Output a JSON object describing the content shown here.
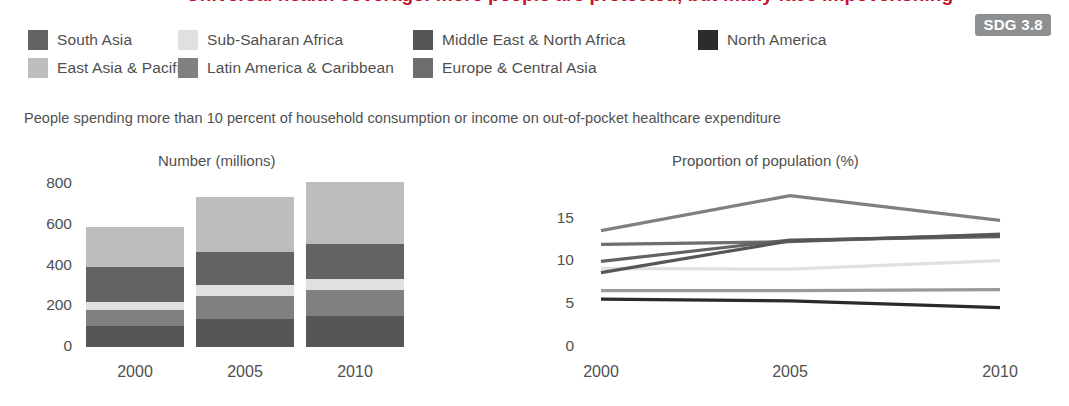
{
  "header": {
    "clipped_title": "Universal health coverage: more people are protected, but many face impoverishing",
    "badge": "SDG 3.8"
  },
  "legend": {
    "rows": [
      [
        {
          "label": "South Asia",
          "color": "#636363",
          "width": 150
        },
        {
          "label": "Sub-Saharan Africa",
          "color": "#e0e0e0",
          "width": 235
        },
        {
          "label": "Middle East & North Africa",
          "color": "#565656",
          "width": 285
        },
        {
          "label": "North America",
          "color": "#2b2b2b",
          "width": 180
        }
      ],
      [
        {
          "label": "East Asia & Pacific",
          "color": "#bdbdbd",
          "width": 150
        },
        {
          "label": "Latin America & Caribbean",
          "color": "#808080",
          "width": 235
        },
        {
          "label": "Europe & Central Asia",
          "color": "#6e6e6e",
          "width": 285
        }
      ]
    ]
  },
  "subtitle": "People spending more than 10 percent of household consumption or income on out-of-pocket healthcare expenditure",
  "chart_data": [
    {
      "type": "bar",
      "title": "Number (millions)",
      "xlabel": "",
      "ylabel": "",
      "categories": [
        "2000",
        "2005",
        "2010"
      ],
      "ylim": [
        0,
        800
      ],
      "yticks": [
        0,
        200,
        400,
        600,
        800
      ],
      "grid": false,
      "stacked": true,
      "series": [
        {
          "name": "East Asia & Pacific",
          "color": "#bdbdbd",
          "values": [
            196,
            273,
            300
          ]
        },
        {
          "name": "South Asia",
          "color": "#636363",
          "values": [
            171,
            160,
            176
          ]
        },
        {
          "name": "Sub-Saharan Africa",
          "color": "#e0e0e0",
          "values": [
            38,
            52,
            54
          ]
        },
        {
          "name": "Latin America & Caribbean",
          "color": "#808080",
          "values": [
            78,
            114,
            128
          ]
        },
        {
          "name": "Europe & Central Asia",
          "color": "#6e6e6e",
          "values": [
            0,
            0,
            0
          ]
        },
        {
          "name": "Middle East & North Africa",
          "color": "#565656",
          "values": [
            104,
            138,
            150
          ]
        },
        {
          "name": "North America",
          "color": "#2b2b2b",
          "values": [
            0,
            0,
            0
          ]
        }
      ],
      "totals": [
        587,
        737,
        808
      ]
    },
    {
      "type": "line",
      "title": "Proportion of population (%)",
      "xlabel": "",
      "ylabel": "",
      "x": [
        "2000",
        "2005",
        "2010"
      ],
      "ylim": [
        0,
        18
      ],
      "yticks": [
        0,
        5,
        10,
        15
      ],
      "grid": false,
      "series": [
        {
          "name": "Latin America & Caribbean",
          "color": "#808080",
          "values": [
            13.6,
            17.7,
            14.8
          ]
        },
        {
          "name": "Europe & Central Asia",
          "color": "#6e6e6e",
          "values": [
            12.0,
            12.3,
            13.2
          ]
        },
        {
          "name": "South Asia",
          "color": "#636363",
          "values": [
            10.0,
            12.5,
            12.9
          ]
        },
        {
          "name": "Sub-Saharan Africa",
          "color": "#e0e0e0",
          "values": [
            9.2,
            9.1,
            10.1
          ]
        },
        {
          "name": "Middle East & North Africa",
          "color": "#565656",
          "values": [
            8.7,
            12.4,
            13.1
          ]
        },
        {
          "name": "East Asia & Pacific",
          "color": "#9a9a9a",
          "values": [
            6.6,
            6.6,
            6.7
          ]
        },
        {
          "name": "North America",
          "color": "#2b2b2b",
          "values": [
            5.6,
            5.4,
            4.6
          ]
        }
      ]
    }
  ]
}
